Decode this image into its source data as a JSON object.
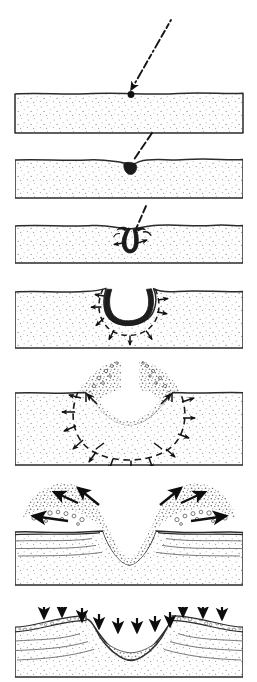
{
  "figure": {
    "title": "Impact crater formation sequence",
    "domain": "Diagram",
    "background_color": "#ffffff",
    "ink_color": "#1a1a1a",
    "stipple_color": "#9a9a9a",
    "cavity_fill": "#1c1c1c",
    "panel_count": 7,
    "panel_left": 15,
    "panel_right": 243,
    "caption": ""
  },
  "panels": [
    {
      "index": 1,
      "name": "panel-contact",
      "label": "",
      "top": 93,
      "bottom": 133,
      "surface_style": "flat-irregular",
      "elements": [
        "target-block",
        "stipple-texture",
        "dashed-trajectory",
        "impactor-dot",
        "trajectory-arrowhead"
      ],
      "trajectory": {
        "start_x": 171,
        "start_y": 20,
        "end_x": 131,
        "end_y": 92,
        "dashed": true,
        "arrowhead": true
      },
      "impactor": {
        "x": 131,
        "y": 94,
        "radius": 3.2
      },
      "arrow_count": 0
    },
    {
      "index": 2,
      "name": "panel-penetration",
      "label": "",
      "top": 158,
      "bottom": 198,
      "surface_style": "dimple",
      "elements": [
        "target-block",
        "stipple-texture",
        "dashed-trajectory",
        "dark-cavity-small",
        "surface-dimple"
      ],
      "trajectory": {
        "start_x": 152,
        "start_y": 135,
        "end_x": 131,
        "end_y": 163,
        "dashed": true,
        "arrowhead": false
      },
      "cavity": {
        "center_x": 130,
        "center_y": 168,
        "width": 13,
        "depth": 11
      },
      "arrow_count": 0
    },
    {
      "index": 3,
      "name": "panel-jetting",
      "label": "",
      "top": 223,
      "bottom": 263,
      "surface_style": "lip-raised",
      "elements": [
        "target-block",
        "stipple-texture",
        "dashed-trajectory",
        "dark-cavity-hook",
        "ejecta-jets",
        "outward-arrows"
      ],
      "trajectory": {
        "start_x": 146,
        "start_y": 206,
        "end_x": 133,
        "end_y": 232,
        "dashed": true,
        "arrowhead": false
      },
      "cavity": {
        "center_x": 130,
        "center_y": 242,
        "width": 22,
        "depth": 22
      },
      "arrow_count": 2
    },
    {
      "index": 4,
      "name": "panel-excavation-early",
      "label": "",
      "top": 288,
      "bottom": 348,
      "surface_style": "rim-uplift",
      "elements": [
        "target-block",
        "stipple-texture",
        "dark-cavity-bowl",
        "dashed-shock-front",
        "radial-arrows"
      ],
      "cavity": {
        "center_x": 131,
        "center_y": 300,
        "width": 50,
        "depth": 34
      },
      "arrow_count": 7
    },
    {
      "index": 5,
      "name": "panel-excavation-flow",
      "label": "",
      "top": 390,
      "bottom": 465,
      "surface_style": "open-crater",
      "elements": [
        "target-block",
        "stipple-texture",
        "ejecta-curtain",
        "dashed-excavation-boundary",
        "radial-arrows",
        "transient-cavity"
      ],
      "cavity": {
        "center_x": 129,
        "center_y": 392,
        "width": 120,
        "depth": 60
      },
      "arrow_count": 12
    },
    {
      "index": 6,
      "name": "panel-overturned-flap",
      "label": "",
      "top": 527,
      "bottom": 585,
      "surface_style": "overturned-flap",
      "elements": [
        "target-block",
        "stipple-texture",
        "overturned-ejecta-flap-left",
        "overturned-ejecta-flap-right",
        "clast-texture",
        "flow-arrows",
        "stratigraphic-layers",
        "transient-cavity"
      ],
      "cavity": {
        "center_x": 129,
        "center_y": 485,
        "width": 116,
        "depth": 72
      },
      "arrow_count": 6
    },
    {
      "index": 7,
      "name": "panel-final-crater",
      "label": "",
      "top": 613,
      "bottom": 677,
      "surface_style": "raised-rim",
      "elements": [
        "target-block",
        "stipple-texture",
        "raised-rim-left",
        "raised-rim-right",
        "ejecta-blanket",
        "fallback-arrows",
        "breccia-lens",
        "stratigraphic-layers"
      ],
      "cavity": {
        "center_x": 131,
        "center_y": 630,
        "width": 130,
        "depth": 45
      },
      "arrow_count": 11
    }
  ],
  "legend": {
    "items": []
  }
}
